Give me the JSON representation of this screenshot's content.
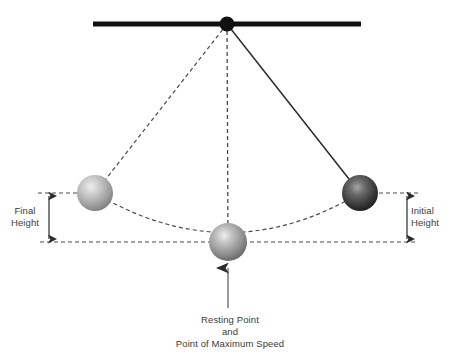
{
  "diagram": {
    "labels": {
      "final_height_line1": "Final",
      "final_height_line2": "Height",
      "initial_height_line1": "Initial",
      "initial_height_line2": "Height",
      "resting_line1": "Resting Point",
      "resting_line2": "and",
      "resting_line3": "Point of Maximum Speed"
    },
    "colors": {
      "support_bar": "#111111",
      "pivot": "#111111",
      "dashed_line": "#4a4a4a",
      "solid_string": "#2b2b2b",
      "arrow": "#2b2b2b",
      "text": "#3b3b3b",
      "bob_left_light": "#e2e2e2",
      "bob_left_dark": "#8d8d8d",
      "bob_center_light": "#e8e8e8",
      "bob_center_dark": "#6e6e6e",
      "bob_right_light": "#9a9a9a",
      "bob_right_dark": "#1e1e1e"
    },
    "geometry": {
      "pivot": {
        "x": 227,
        "y": 24
      },
      "support_bar": {
        "x1": 93,
        "x2": 361,
        "y": 24,
        "thickness": 5
      },
      "bob_left": {
        "x": 95,
        "y": 193,
        "r": 18
      },
      "bob_center": {
        "x": 228,
        "y": 242,
        "r": 19
      },
      "bob_right": {
        "x": 360,
        "y": 193,
        "r": 18
      },
      "height_top_y": 193,
      "height_base_y": 242,
      "left_measure_x": 49,
      "right_measure_x": 407,
      "baseline_x1": 40,
      "baseline_x2": 416,
      "callout_arrow": {
        "x": 228,
        "y_tail": 308,
        "y_head": 264
      }
    }
  }
}
